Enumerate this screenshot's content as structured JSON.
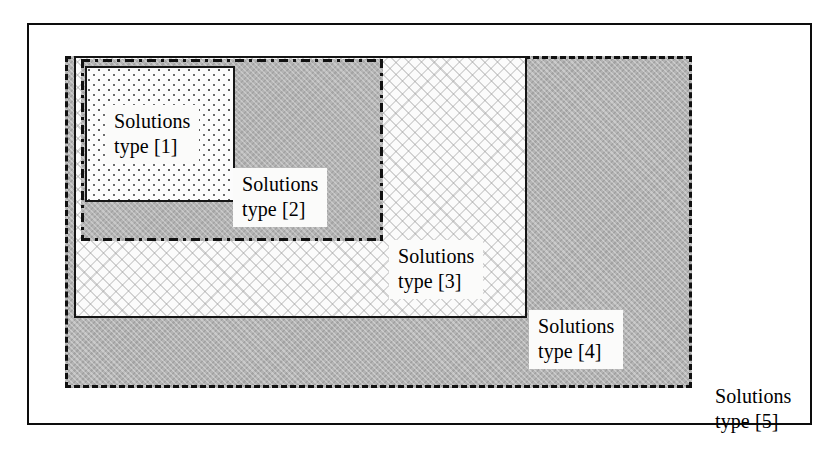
{
  "diagram": {
    "regions": [
      {
        "id": "region-1",
        "label_line1": "Solutions",
        "label_line2": "type [1]",
        "label_text": "Solutions\ntype [1]",
        "border_style": "solid",
        "fill_style": "dotted-stipple",
        "fill_color": "#fcfcfc",
        "border_color": "#161616",
        "nesting_level": 1
      },
      {
        "id": "region-2",
        "label_line1": "Solutions",
        "label_line2": "type [2]",
        "label_text": "Solutions\ntype [2]",
        "border_style": "dash-dot",
        "fill_style": "dark-gray-crosshatch",
        "fill_color": "#b4b4b4",
        "border_color": "#111111",
        "nesting_level": 2
      },
      {
        "id": "region-3",
        "label_line1": "Solutions",
        "label_line2": "type [3]",
        "label_text": "Solutions\ntype [3]",
        "border_style": "solid",
        "fill_style": "light-hatch",
        "fill_color": "#fbfbfb",
        "border_color": "#151515",
        "nesting_level": 3
      },
      {
        "id": "region-4",
        "label_line1": "Solutions",
        "label_line2": "type [4]",
        "label_text": "Solutions\ntype [4]",
        "border_style": "dashed",
        "fill_style": "dark-gray-crosshatch",
        "fill_color": "#b4b4b4",
        "border_color": "#111111",
        "nesting_level": 4
      },
      {
        "id": "region-5",
        "label_line1": "Solutions",
        "label_line2": "type [5]",
        "label_text": "Solutions\ntype [5]",
        "border_style": "solid",
        "fill_style": "plain-white",
        "fill_color": "#ffffff",
        "border_color": "#0d0d0d",
        "nesting_level": 5
      }
    ]
  }
}
